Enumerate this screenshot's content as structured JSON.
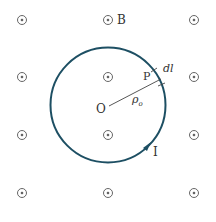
{
  "diagram": {
    "type": "magnetic field loop (Ampere's law)",
    "colors": {
      "loop": "#1d4f63",
      "symbols": "#555555",
      "text": "#333333",
      "radius_line": "#444444"
    },
    "field_symbol": "dot-in-circle (out of page)",
    "field_grid": {
      "columns_x": [
        22,
        108,
        194
      ],
      "rows_y": [
        20,
        77,
        135,
        193
      ]
    },
    "loop": {
      "center": [
        108,
        105
      ],
      "radius": 57,
      "direction": "counterclockwise"
    },
    "labels": {
      "field": "B",
      "center": "O",
      "point": "P",
      "element": "dl",
      "radius": "ρ",
      "radius_sub": "o",
      "current": "I"
    }
  }
}
